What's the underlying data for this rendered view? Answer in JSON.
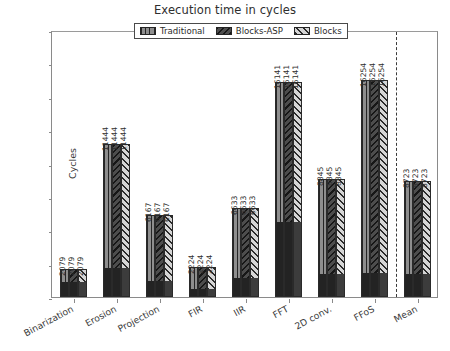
{
  "chart_data": {
    "type": "bar",
    "title": "Execution time in cycles",
    "xlabel": "",
    "ylabel": "Cycles",
    "ylim": [
      0,
      20000
    ],
    "yticks": [
      0,
      2500,
      5000,
      7500,
      10000,
      12500,
      15000,
      17500,
      20000
    ],
    "grid": false,
    "legend_position": "upper center",
    "categories": [
      "Binarization",
      "Erosion",
      "Projection",
      "FIR",
      "IIR",
      "FFT",
      "2D conv.",
      "FFoS",
      "Mean"
    ],
    "series": [
      {
        "name": "Traditional",
        "hatch": "vertical-lines",
        "color": "#8e8e8e",
        "values": [
          2079,
          11444,
          6167,
          2224,
          6633,
          16141,
          8845,
          16254,
          8723
        ]
      },
      {
        "name": "Blocks-ASP",
        "hatch": "backslash",
        "color": "#4d4d4d",
        "values": [
          2079,
          11444,
          6167,
          2224,
          6633,
          16141,
          8845,
          16254,
          8723
        ]
      },
      {
        "name": "Blocks",
        "hatch": "forward-slash",
        "color": "#d5d5d5",
        "values": [
          2079,
          11444,
          6167,
          2224,
          6633,
          16141,
          8845,
          16254,
          8723
        ]
      }
    ],
    "base_overlay": {
      "description": "solid dark sub-region drawn at the base of each group",
      "values": [
        1020,
        2100,
        1160,
        560,
        1320,
        5520,
        1650,
        1700,
        1640
      ]
    },
    "value_labels": [
      "2079",
      "11444",
      "6167",
      "2224",
      "6633",
      "16141",
      "8845",
      "16254",
      "8723"
    ],
    "separator_after_category": "FFoS"
  },
  "legend": {
    "items": [
      {
        "label": "Traditional"
      },
      {
        "label": "Blocks-ASP"
      },
      {
        "label": "Blocks"
      }
    ]
  }
}
